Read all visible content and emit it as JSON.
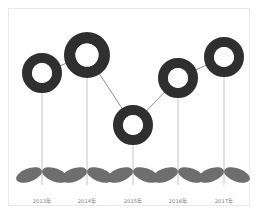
{
  "chart_data": {
    "type": "line",
    "title": "",
    "subtitle": "",
    "xlabel": "",
    "ylabel": "",
    "categories": [
      "2013年",
      "2014年",
      "2015年",
      "2016年",
      "2017年"
    ],
    "values": [
      68,
      82,
      38,
      64,
      80
    ],
    "ylim": [
      0,
      100
    ],
    "grid": false,
    "legend": [],
    "legend_position": "none",
    "annotations": [],
    "series": [
      {
        "name": "series-1",
        "values": [
          68,
          82,
          38,
          64,
          80
        ]
      }
    ],
    "marker_style": "donut-ring",
    "point_pixels": [
      {
        "label": "2013年",
        "cx": 42,
        "cy": 73,
        "r_outer": 20,
        "r_inner": 10
      },
      {
        "label": "2014年",
        "cx": 87,
        "cy": 55,
        "r_outer": 23,
        "r_inner": 11.5
      },
      {
        "label": "2015年",
        "cx": 133,
        "cy": 125,
        "r_outer": 20,
        "r_inner": 10
      },
      {
        "label": "2016年",
        "cx": 178,
        "cy": 78,
        "r_outer": 20,
        "r_inner": 10
      },
      {
        "label": "2017年",
        "cx": 224,
        "cy": 57,
        "r_outer": 20,
        "r_inner": 10
      }
    ],
    "baseline_y": 181,
    "label_y": 197
  },
  "colors": {
    "marker_ring": "#2f2f2f",
    "marker_hole": "#ffffff",
    "connector_line": "#8e8e8e",
    "stem_line": "#bdbdbd",
    "leaf": "#6e6e6e",
    "frame_border": "#e8e8e8",
    "background": "#ffffff",
    "label_text": "#7c7c7c"
  },
  "axis": {
    "tick_labels": [
      "2013年",
      "2014年",
      "2015年",
      "2016年",
      "2017年"
    ]
  },
  "decoration": {
    "leaf_count_per_plant": 2,
    "plant_count": 5
  }
}
